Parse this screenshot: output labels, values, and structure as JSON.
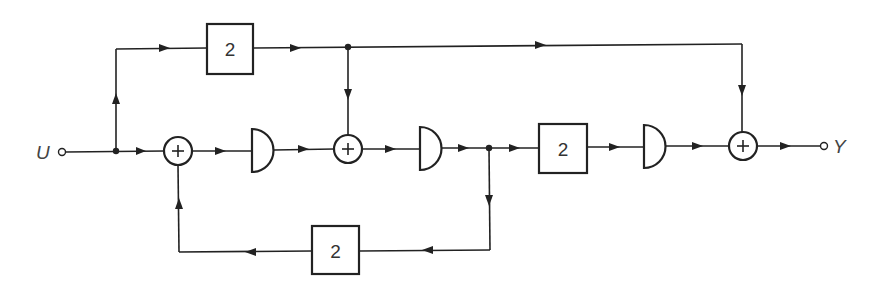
{
  "diagram": {
    "type": "signal-flow block diagram",
    "input": {
      "label": "U"
    },
    "output": {
      "label": "Y"
    },
    "gain_blocks": [
      {
        "id": "top",
        "label": "2"
      },
      {
        "id": "forward",
        "label": "2"
      },
      {
        "id": "feedback",
        "label": "2"
      }
    ],
    "summing_junctions": [
      {
        "id": "sum1",
        "symbol": "+"
      },
      {
        "id": "sum2",
        "symbol": "+"
      },
      {
        "id": "sum3",
        "symbol": "+"
      }
    ],
    "delay_elements": [
      {
        "id": "delay1"
      },
      {
        "id": "delay2"
      },
      {
        "id": "delay3"
      }
    ]
  }
}
